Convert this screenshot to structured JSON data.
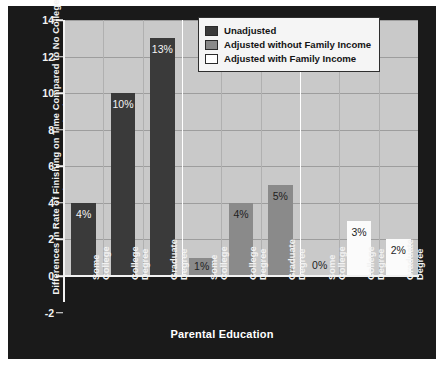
{
  "chart_data": {
    "type": "bar",
    "title": "",
    "xlabel": "Parental Education",
    "ylabel": "Differences in Rate of Finishing on Time Compared to No College\n(Percentage Points)",
    "ylim": [
      -2,
      14
    ],
    "yticks": [
      -2,
      0,
      2,
      4,
      6,
      8,
      10,
      12,
      14
    ],
    "grid": "horizontal-and-vertical",
    "legend_position": "top-right",
    "categories": [
      "Some College",
      "College Degree",
      "Graduate Degree"
    ],
    "groups": [
      {
        "name": "Unadjusted",
        "color": "#3a3a3a",
        "bars": [
          {
            "category": "Some College",
            "value": 4,
            "label": "4%"
          },
          {
            "category": "College Degree",
            "value": 10,
            "label": "10%"
          },
          {
            "category": "Graduate Degree",
            "value": 13,
            "label": "13%"
          }
        ]
      },
      {
        "name": "Adjusted without Family Income",
        "color": "#8a8a8a",
        "bars": [
          {
            "category": "Some College",
            "value": 1,
            "label": "1%"
          },
          {
            "category": "College Degree",
            "value": 4,
            "label": "4%"
          },
          {
            "category": "Graduate Degree",
            "value": 5,
            "label": "5%"
          }
        ]
      },
      {
        "name": "Adjusted with Family Income",
        "color": "#ffffff",
        "bars": [
          {
            "category": "Some College",
            "value": 0,
            "label": "0%"
          },
          {
            "category": "College Degree",
            "value": 3,
            "label": "3%"
          },
          {
            "category": "Graduate Degree",
            "value": 2,
            "label": "2%"
          }
        ]
      }
    ],
    "series": [
      {
        "name": "Unadjusted",
        "values": [
          4,
          10,
          13
        ]
      },
      {
        "name": "Adjusted without Family Income",
        "values": [
          1,
          4,
          5
        ]
      },
      {
        "name": "Adjusted with Family Income",
        "values": [
          0,
          3,
          2
        ]
      }
    ]
  },
  "legend": {
    "items": [
      {
        "label": "Unadjusted",
        "swatch": "#3a3a3a"
      },
      {
        "label": "Adjusted without Family Income",
        "swatch": "#8a8a8a"
      },
      {
        "label": "Adjusted with Family Income",
        "swatch": "#ffffff"
      }
    ]
  },
  "colors": {
    "panel_background": "#1a1a1a",
    "plot_background": "#c9c9c9",
    "axis": "#f2f2f2",
    "gridline": "#9d9d9d",
    "series_unadjusted": "#3a3a3a",
    "series_adjusted_no_income": "#8a8a8a",
    "series_adjusted_income": "#ffffff"
  }
}
